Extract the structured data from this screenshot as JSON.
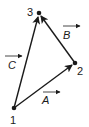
{
  "diagram": {
    "type": "vector-triangle",
    "points": [
      {
        "id": "1",
        "label": "1",
        "x": 14,
        "y": 108
      },
      {
        "id": "2",
        "label": "2",
        "x": 75,
        "y": 63
      },
      {
        "id": "3",
        "label": "3",
        "x": 39,
        "y": 13
      }
    ],
    "vectors": [
      {
        "name": "A",
        "label": "A",
        "from": "1",
        "to": "2"
      },
      {
        "name": "B",
        "label": "B",
        "from": "2",
        "to": "3"
      },
      {
        "name": "C",
        "label": "C",
        "from": "1",
        "to": "3"
      }
    ],
    "colors": {
      "stroke": "#1a1a1a",
      "background": "#ffffff"
    }
  }
}
